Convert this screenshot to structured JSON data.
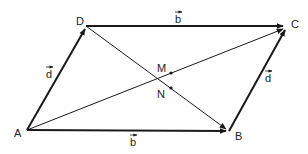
{
  "diagram": {
    "points": {
      "A": {
        "label": "A",
        "x": 27,
        "y": 130
      },
      "B": {
        "label": "B",
        "x": 229,
        "y": 131
      },
      "C": {
        "label": "C",
        "x": 286,
        "y": 27
      },
      "D": {
        "label": "D",
        "x": 86,
        "y": 26
      },
      "M": {
        "label": "M",
        "x": 171,
        "y": 73
      },
      "N": {
        "label": "N",
        "x": 171,
        "y": 88
      }
    },
    "vectors": [
      {
        "from": "A",
        "to": "D",
        "label": "d"
      },
      {
        "from": "D",
        "to": "C",
        "label": "b"
      },
      {
        "from": "A",
        "to": "B",
        "label": "b"
      },
      {
        "from": "B",
        "to": "C",
        "label": "d"
      }
    ],
    "diagonals": [
      {
        "from": "A",
        "to": "C"
      },
      {
        "from": "D",
        "to": "B"
      }
    ],
    "labels": {
      "A": "A",
      "B": "B",
      "C": "C",
      "D": "D",
      "M": "M",
      "N": "N",
      "vec_d_left": "d",
      "vec_b_top": "b",
      "vec_b_bottom": "b",
      "vec_d_right": "d"
    },
    "colors": {
      "stroke": "#1a1a1a",
      "text": "#222222",
      "background": "#ffffff"
    }
  }
}
